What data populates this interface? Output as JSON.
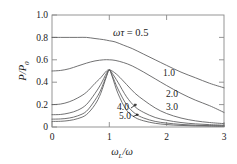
{
  "chart_data": {
    "type": "line",
    "title": "",
    "xlabel": "ωL/ω",
    "ylabel": "P/P0",
    "xlim": [
      0,
      3
    ],
    "ylim": [
      0,
      1.0
    ],
    "xticks": [
      "0",
      "1",
      "2",
      "3"
    ],
    "yticks": [
      "0",
      "0.2",
      "0.4",
      "0.6",
      "0.8",
      "1.0"
    ],
    "grid": false,
    "legend_position": "inline-curve-labels",
    "legend_prefix": "ωτ = 0.5",
    "series": [
      {
        "name": "0.5",
        "label": "0.5",
        "omega_tau": 0.5,
        "x": [
          0,
          0.15,
          0.3,
          0.45,
          0.6,
          0.75,
          0.9,
          1.0,
          1.1,
          1.25,
          1.4,
          1.6,
          1.8,
          2.0,
          2.25,
          2.5,
          2.75,
          3.0
        ],
        "y": [
          0.8,
          0.8,
          0.8,
          0.8,
          0.8,
          0.79,
          0.78,
          0.77,
          0.76,
          0.73,
          0.7,
          0.65,
          0.6,
          0.55,
          0.49,
          0.44,
          0.39,
          0.35
        ]
      },
      {
        "name": "1.0",
        "label": "1.0",
        "omega_tau": 1.0,
        "x": [
          0,
          0.15,
          0.3,
          0.45,
          0.6,
          0.75,
          0.9,
          1.0,
          1.1,
          1.25,
          1.4,
          1.6,
          1.8,
          2.0,
          2.25,
          2.5,
          2.75,
          3.0
        ],
        "y": [
          0.5,
          0.505,
          0.52,
          0.545,
          0.57,
          0.59,
          0.6,
          0.6,
          0.595,
          0.575,
          0.545,
          0.49,
          0.43,
          0.37,
          0.3,
          0.24,
          0.19,
          0.13
        ]
      },
      {
        "name": "2.0",
        "label": "2.0",
        "omega_tau": 2.0,
        "x": [
          0,
          0.15,
          0.3,
          0.45,
          0.6,
          0.75,
          0.85,
          0.95,
          1.0,
          1.05,
          1.15,
          1.3,
          1.45,
          1.6,
          1.8,
          2.0,
          2.25,
          2.5,
          2.75,
          3.0
        ],
        "y": [
          0.2,
          0.205,
          0.225,
          0.26,
          0.31,
          0.39,
          0.44,
          0.5,
          0.51,
          0.5,
          0.46,
          0.38,
          0.3,
          0.24,
          0.17,
          0.12,
          0.08,
          0.055,
          0.04,
          0.03
        ]
      },
      {
        "name": "3.0",
        "label": "3.0",
        "omega_tau": 3.0,
        "x": [
          0,
          0.15,
          0.3,
          0.45,
          0.6,
          0.75,
          0.85,
          0.95,
          1.0,
          1.05,
          1.15,
          1.3,
          1.45,
          1.6,
          1.8,
          2.0,
          2.25,
          2.5,
          2.75,
          3.0
        ],
        "y": [
          0.11,
          0.112,
          0.125,
          0.15,
          0.2,
          0.3,
          0.38,
          0.48,
          0.51,
          0.48,
          0.4,
          0.27,
          0.18,
          0.13,
          0.085,
          0.06,
          0.04,
          0.028,
          0.021,
          0.016
        ]
      },
      {
        "name": "4.0",
        "label": "4.0",
        "omega_tau": 4.0,
        "x": [
          0,
          0.15,
          0.3,
          0.45,
          0.6,
          0.75,
          0.85,
          0.95,
          1.0,
          1.05,
          1.15,
          1.3,
          1.45,
          1.6,
          1.8,
          2.0,
          2.25,
          2.5,
          2.75,
          3.0
        ],
        "y": [
          0.07,
          0.072,
          0.08,
          0.1,
          0.14,
          0.24,
          0.33,
          0.46,
          0.51,
          0.46,
          0.34,
          0.2,
          0.12,
          0.08,
          0.05,
          0.035,
          0.023,
          0.016,
          0.012,
          0.01
        ]
      },
      {
        "name": "5.0",
        "label": "5.0",
        "omega_tau": 5.0,
        "x": [
          0,
          0.15,
          0.3,
          0.45,
          0.6,
          0.75,
          0.85,
          0.95,
          1.0,
          1.05,
          1.15,
          1.3,
          1.45,
          1.6,
          1.8,
          2.0,
          2.25,
          2.5,
          2.75,
          3.0
        ],
        "y": [
          0.05,
          0.051,
          0.058,
          0.075,
          0.11,
          0.2,
          0.3,
          0.45,
          0.51,
          0.45,
          0.3,
          0.15,
          0.085,
          0.055,
          0.033,
          0.022,
          0.014,
          0.01,
          0.008,
          0.006
        ]
      }
    ],
    "annotations": [
      {
        "text": "ωτ = 0.5",
        "x": 1.05,
        "y": 0.87
      },
      {
        "text": "1.0",
        "x": 2.0,
        "y": 0.43
      },
      {
        "text": "2.0",
        "x": 2.05,
        "y": 0.245
      },
      {
        "text": "3.0",
        "x": 2.05,
        "y": 0.135
      },
      {
        "text": "4.0",
        "x": 1.18,
        "y": 0.135
      },
      {
        "text": "5.0",
        "x": 1.2,
        "y": 0.06
      }
    ]
  },
  "axes": {
    "ylabel_main": "P",
    "ylabel_slash": "/",
    "ylabel_den": "P",
    "ylabel_den_sub": "0",
    "xlabel_num": "ω",
    "xlabel_num_sub": "L",
    "xlabel_slash": "/",
    "xlabel_den": "ω"
  },
  "legend": {
    "omega": "ω",
    "tau": "τ",
    "equals_value": "= 0.5"
  }
}
